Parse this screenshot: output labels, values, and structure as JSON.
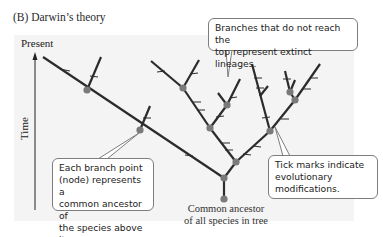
{
  "panel_title": "(B) Darwin’s theory",
  "axis": {
    "top_label": "Present",
    "vertical_label": "Time"
  },
  "root_label": {
    "line1": "Common ancestor",
    "line2": "of all species in tree"
  },
  "callouts": {
    "extinct": {
      "line1": "Branches that do not reach the",
      "line2": "top represent extinct lineages."
    },
    "node": {
      "line1": "Each branch point",
      "line2": "(node) represents a",
      "line3": "common ancestor of",
      "line4": "the species above it."
    },
    "tick": {
      "line1": "Tick marks indicate",
      "line2": "evolutionary",
      "line3": "modifications."
    }
  },
  "colors": {
    "branch": "#2b2b2b",
    "node": "#7a7a7a",
    "callout_border": "#7d7d7d",
    "panel_bg": "#f4f4f4"
  }
}
